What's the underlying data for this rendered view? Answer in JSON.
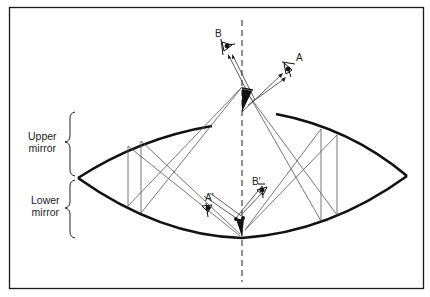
{
  "diagram": {
    "title": "",
    "labels": {
      "upper_mirror": [
        "Upper",
        "mirror"
      ],
      "lower_mirror": [
        "Lower",
        "mirror"
      ],
      "viewer_a": "A",
      "viewer_b": "B",
      "viewer_a_prime": "A′",
      "viewer_b_prime": "B′"
    },
    "colors": {
      "line": "#1a1a1a",
      "ray": "#444444",
      "background": "#ffffff"
    }
  }
}
